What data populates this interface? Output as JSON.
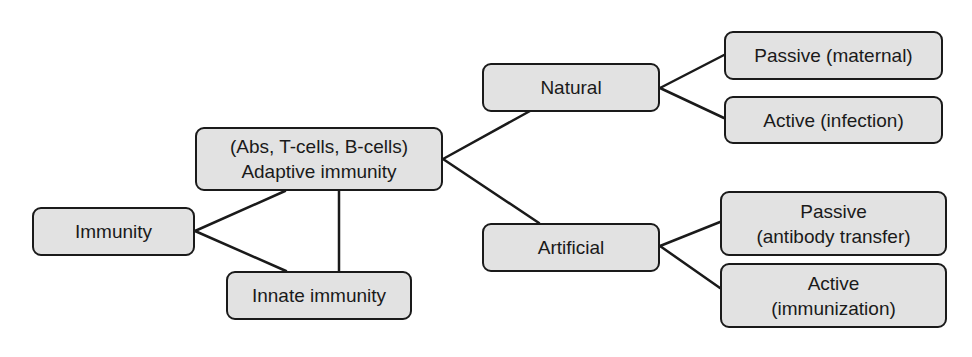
{
  "diagram": {
    "title": "",
    "colors": {
      "box_fill": "#e2e2e2",
      "box_border": "#1a1a1a",
      "line": "#1a1a1a",
      "text": "#1a1a1a"
    },
    "nodes": {
      "immunity": {
        "lines": [
          "Immunity"
        ]
      },
      "adaptive": {
        "lines": [
          "(Abs, T-cells, B-cells)",
          "Adaptive immunity"
        ]
      },
      "innate": {
        "lines": [
          "Innate immunity"
        ]
      },
      "natural": {
        "lines": [
          "Natural"
        ]
      },
      "artificial": {
        "lines": [
          "Artificial"
        ]
      },
      "passive_maternal": {
        "lines": [
          "Passive (maternal)"
        ]
      },
      "active_infection": {
        "lines": [
          "Active (infection)"
        ]
      },
      "passive_antibody": {
        "lines": [
          "Passive",
          "(antibody transfer)"
        ]
      },
      "active_immunization": {
        "lines": [
          "Active",
          "(immunization)"
        ]
      }
    },
    "edges": [
      {
        "from": "immunity",
        "to": "adaptive"
      },
      {
        "from": "immunity",
        "to": "innate"
      },
      {
        "from": "adaptive",
        "to": "innate"
      },
      {
        "from": "adaptive",
        "to": "natural"
      },
      {
        "from": "adaptive",
        "to": "artificial"
      },
      {
        "from": "natural",
        "to": "passive_maternal"
      },
      {
        "from": "natural",
        "to": "active_infection"
      },
      {
        "from": "artificial",
        "to": "passive_antibody"
      },
      {
        "from": "artificial",
        "to": "active_immunization"
      }
    ]
  }
}
